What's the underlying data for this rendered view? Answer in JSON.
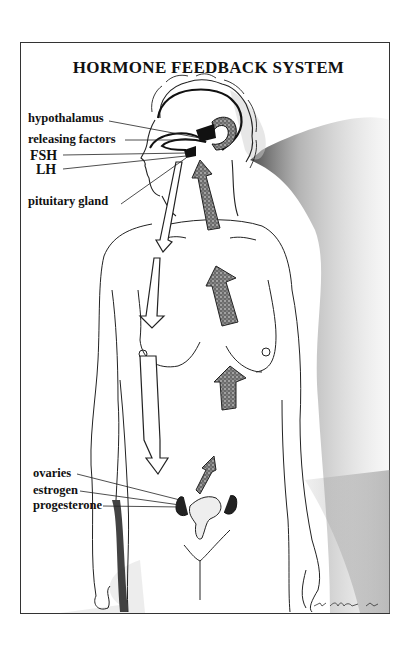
{
  "title": "HORMONE FEEDBACK SYSTEM",
  "brain_labels": [
    {
      "id": "hypothalamus",
      "text": "hypothalamus"
    },
    {
      "id": "releasing-factors",
      "text": "releasing factors"
    },
    {
      "id": "fsh",
      "text": "FSH"
    },
    {
      "id": "lh",
      "text": "LH"
    },
    {
      "id": "pituitary-gland",
      "text": "pituitary gland"
    }
  ],
  "pelvic_labels": [
    {
      "id": "ovaries",
      "text": "ovaries"
    },
    {
      "id": "estrogen",
      "text": "estrogen"
    },
    {
      "id": "progesterone",
      "text": "progesterone"
    }
  ],
  "arrows": {
    "downward_hollow": 3,
    "upward_stippled": 4
  },
  "colors": {
    "ink": "#111111",
    "stipple": "#555555",
    "shadow": "#8a8a8a"
  }
}
